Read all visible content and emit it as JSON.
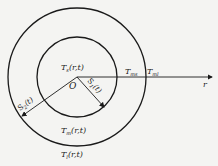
{
  "diagram": {
    "center_label": "O",
    "axis_label": "r",
    "inner_region": {
      "name": "T",
      "sub": "s",
      "args": "(r,t)"
    },
    "annulus_region": {
      "name": "T",
      "sub": "m",
      "args": "(r,t)"
    },
    "outer_region": {
      "name": "T",
      "sub": "l",
      "args": "(r,t)"
    },
    "inner_radius": {
      "name": "S",
      "sub": "1",
      "args": "(t)"
    },
    "outer_radius": {
      "name": "S",
      "sub": "2",
      "args": "(t)"
    },
    "inner_boundary_temp": {
      "name": "T",
      "sub": "ms"
    },
    "outer_boundary_temp": {
      "name": "T",
      "sub": "ml"
    },
    "colors": {
      "line": "#1a1a1a",
      "background": "#f4f4f2"
    }
  }
}
